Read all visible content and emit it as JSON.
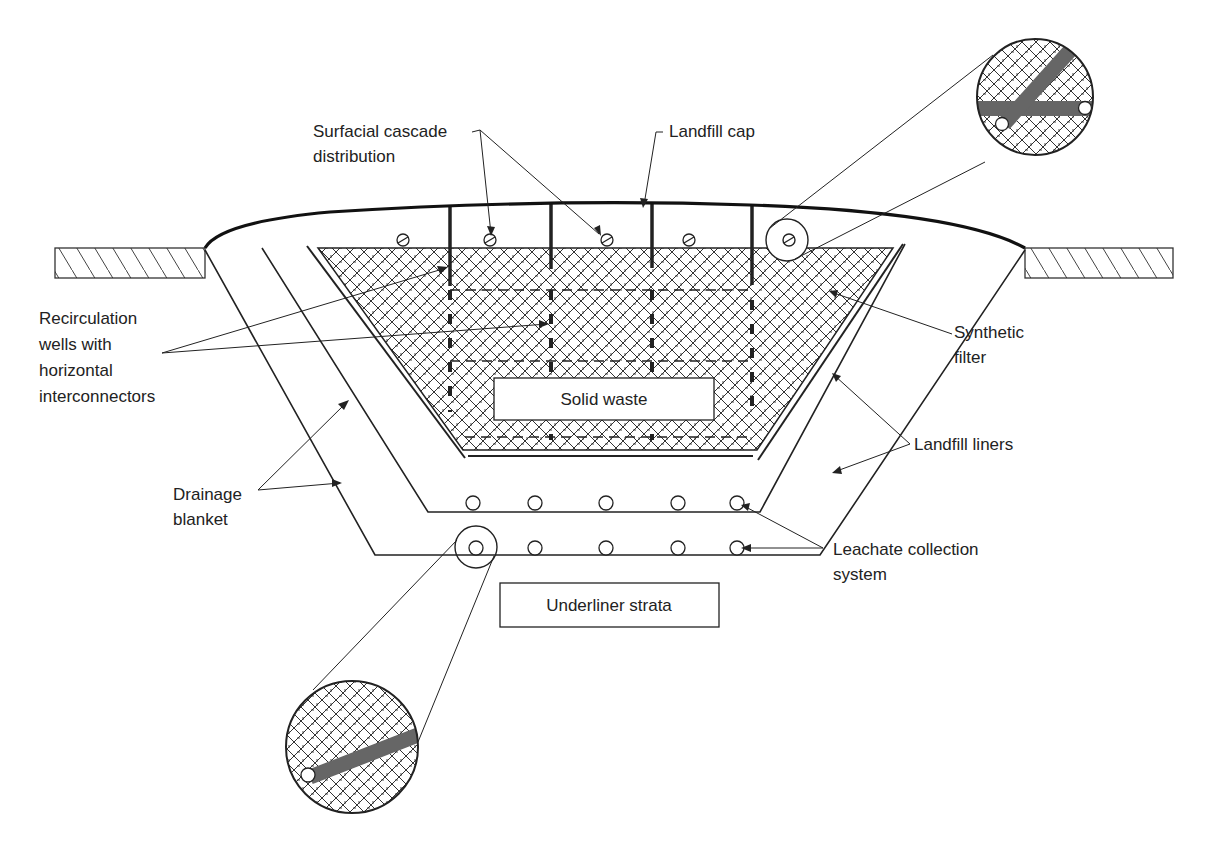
{
  "figure": {
    "colors": {
      "line": "#222222",
      "pipe_fill": "#666666",
      "background": "#ffffff"
    }
  },
  "labels": {
    "surfacial_cascade": [
      "Surfacial cascade",
      "distribution"
    ],
    "landfill_cap": "Landfill cap",
    "recirculation_wells": [
      "Recirculation",
      "wells with",
      "horizontal",
      "interconnectors"
    ],
    "synthetic_filter": [
      "Synthetic",
      "filter"
    ],
    "landfill_liners": "Landfill liners",
    "drainage_blanket": [
      "Drainage",
      "blanket"
    ],
    "leachate_collection": [
      "Leachate collection",
      "system"
    ],
    "solid_waste": "Solid waste",
    "underliner_strata": "Underliner strata"
  },
  "components": {
    "recirculation_well_count": 4,
    "distribution_nozzle_count": 5,
    "upper_collection_pipes": 5,
    "lower_collection_pipes": 5,
    "detail_callouts": 2
  }
}
